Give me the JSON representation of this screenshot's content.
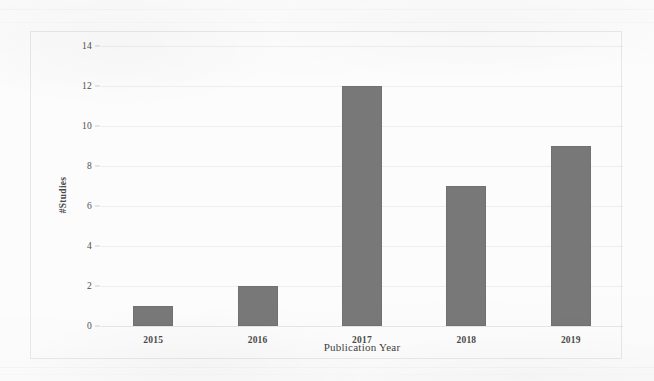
{
  "chart_data": {
    "type": "bar",
    "title": "",
    "subtitle": "",
    "xlabel": "Publication Year",
    "ylabel": "#Studies",
    "categories": [
      "2015",
      "2016",
      "2017",
      "2018",
      "2019"
    ],
    "values": [
      1,
      2,
      12,
      7,
      9
    ],
    "series": [
      {
        "name": "#Studies",
        "values": [
          1,
          2,
          12,
          7,
          9
        ]
      }
    ],
    "ylim": [
      0,
      14
    ],
    "ytick_labels": [
      "0",
      "2",
      "4",
      "6",
      "8",
      "10",
      "12",
      "14"
    ],
    "ytick_values": [
      0,
      2,
      4,
      6,
      8,
      10,
      12,
      14
    ],
    "xtick_labels": [
      "2015",
      "2016",
      "2017",
      "2018",
      "2019"
    ],
    "grid": true,
    "grid_axis": "y",
    "legend": false,
    "legend_position": "none",
    "bar_color": "#787878",
    "grid_color": "#e0e0e0",
    "axis_text_color": "#4a4a4a",
    "plot_border_color": "#e8e8e8",
    "background_color": "#fcfcfc"
  },
  "axes": {
    "y_title": "#Studies",
    "x_title": "Publication Year"
  },
  "ticks": {
    "y": [
      {
        "label": "14",
        "value": 14
      },
      {
        "label": "12",
        "value": 12
      },
      {
        "label": "10",
        "value": 10
      },
      {
        "label": "8",
        "value": 8
      },
      {
        "label": "6",
        "value": 6
      },
      {
        "label": "4",
        "value": 4
      },
      {
        "label": "2",
        "value": 2
      },
      {
        "label": "0",
        "value": 0
      }
    ]
  },
  "bars": [
    {
      "category": "2015",
      "value": 1
    },
    {
      "category": "2016",
      "value": 2
    },
    {
      "category": "2017",
      "value": 12
    },
    {
      "category": "2018",
      "value": 7
    },
    {
      "category": "2019",
      "value": 9
    }
  ]
}
